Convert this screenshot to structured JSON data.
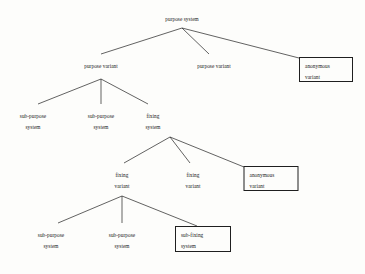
{
  "diagram": {
    "type": "tree",
    "nodes": [
      {
        "id": "root",
        "lines": [
          "purpose system"
        ],
        "boxed": false,
        "x": 182,
        "y": 14,
        "width": 64
      },
      {
        "id": "purpose-variant-1",
        "lines": [
          "purpose variant"
        ],
        "boxed": false,
        "x": 101,
        "y": 61,
        "width": 66
      },
      {
        "id": "purpose-variant-2",
        "lines": [
          "purpose variant"
        ],
        "boxed": false,
        "x": 214,
        "y": 61,
        "width": 66
      },
      {
        "id": "anonymous-variant-1",
        "lines": [
          "anonymous",
          "variant"
        ],
        "boxed": true,
        "x": 326,
        "y": 57,
        "width": 54,
        "height": 25
      },
      {
        "id": "sub-purpose-system-1",
        "lines": [
          "sub-purpose",
          "system"
        ],
        "boxed": false,
        "x": 33,
        "y": 111,
        "width": 54
      },
      {
        "id": "sub-purpose-system-2",
        "lines": [
          "sub-purpose",
          "system"
        ],
        "boxed": false,
        "x": 101,
        "y": 111,
        "width": 54
      },
      {
        "id": "fixing-system",
        "lines": [
          "fixing",
          "system"
        ],
        "boxed": false,
        "x": 153,
        "y": 111,
        "width": 36
      },
      {
        "id": "fixing-variant-1",
        "lines": [
          "fixing",
          "variant"
        ],
        "boxed": false,
        "x": 122,
        "y": 170,
        "width": 36
      },
      {
        "id": "fixing-variant-2",
        "lines": [
          "fixing",
          "variant"
        ],
        "boxed": false,
        "x": 193,
        "y": 170,
        "width": 36
      },
      {
        "id": "anonymous-variant-2",
        "lines": [
          "anonymous",
          "variant"
        ],
        "boxed": true,
        "x": 271,
        "y": 166,
        "width": 55,
        "height": 25
      },
      {
        "id": "sub-purpose-system-3",
        "lines": [
          "sub-purpose",
          "system"
        ],
        "boxed": false,
        "x": 51,
        "y": 230,
        "width": 54
      },
      {
        "id": "sub-purpose-system-4",
        "lines": [
          "sub-purpose",
          "system"
        ],
        "boxed": false,
        "x": 122,
        "y": 230,
        "width": 54
      },
      {
        "id": "sub-fixing-system",
        "lines": [
          "sub-fixing",
          "system"
        ],
        "boxed": true,
        "x": 203,
        "y": 226,
        "width": 56,
        "height": 26
      }
    ],
    "edges": [
      {
        "from": "root",
        "to": "purpose-variant-1",
        "x1": 182,
        "y1": 28,
        "x2": 101,
        "y2": 54
      },
      {
        "from": "root",
        "to": "purpose-variant-2",
        "x1": 182,
        "y1": 28,
        "x2": 209,
        "y2": 54
      },
      {
        "from": "root",
        "to": "anonymous-variant-1",
        "x1": 182,
        "y1": 28,
        "x2": 299,
        "y2": 58
      },
      {
        "from": "purpose-variant-1",
        "to": "sub-purpose-system-1",
        "x1": 101,
        "y1": 79,
        "x2": 38,
        "y2": 104
      },
      {
        "from": "purpose-variant-1",
        "to": "sub-purpose-system-2",
        "x1": 101,
        "y1": 79,
        "x2": 101,
        "y2": 104
      },
      {
        "from": "purpose-variant-1",
        "to": "fixing-system",
        "x1": 101,
        "y1": 79,
        "x2": 148,
        "y2": 104
      },
      {
        "from": "fixing-system",
        "to": "fixing-variant-1",
        "x1": 170,
        "y1": 137,
        "x2": 124,
        "y2": 163
      },
      {
        "from": "fixing-system",
        "to": "fixing-variant-2",
        "x1": 170,
        "y1": 137,
        "x2": 190,
        "y2": 163
      },
      {
        "from": "fixing-system",
        "to": "anonymous-variant-2",
        "x1": 170,
        "y1": 137,
        "x2": 244,
        "y2": 167
      },
      {
        "from": "fixing-variant-1",
        "to": "sub-purpose-system-3",
        "x1": 122,
        "y1": 196,
        "x2": 58,
        "y2": 223
      },
      {
        "from": "fixing-variant-1",
        "to": "sub-purpose-system-4",
        "x1": 122,
        "y1": 196,
        "x2": 122,
        "y2": 223
      },
      {
        "from": "fixing-variant-1",
        "to": "sub-fixing-system",
        "x1": 122,
        "y1": 196,
        "x2": 197,
        "y2": 226
      }
    ],
    "colors": {
      "line": "#1f1f1f",
      "text": "#1a1a1a",
      "background": "#fdfdfb"
    }
  }
}
